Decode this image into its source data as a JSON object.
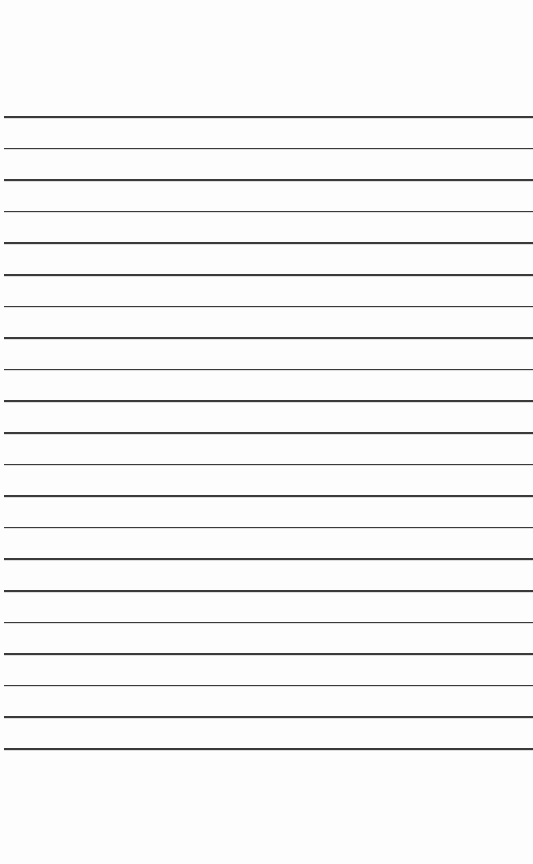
{
  "page": {
    "type": "lined-paper",
    "background_color": "#fdfdfd",
    "line_color": "#3a3a3a",
    "line_count": 21,
    "first_line_y": 116,
    "line_spacing": 31.6,
    "line_left": 4,
    "text": []
  }
}
